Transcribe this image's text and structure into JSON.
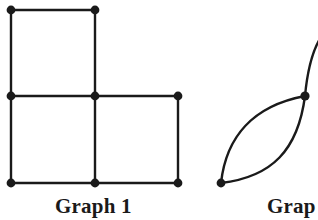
{
  "figure": {
    "width": 318,
    "height": 220,
    "background_color": "#ffffff",
    "stroke_color": "#1a1a1a",
    "vertex_color": "#1a1a1a",
    "stroke_width": 2.4,
    "vertex_radius": 4.2
  },
  "graph1": {
    "caption": "Graph 1",
    "description": "grid graph of three unit squares in an L shape",
    "vertex_count": 7,
    "edge_count": 9,
    "vertices": [
      {
        "id": "v-top-left",
        "x": 11,
        "y": 10
      },
      {
        "id": "v-top-mid",
        "x": 95,
        "y": 10
      },
      {
        "id": "v-mid-left",
        "x": 11,
        "y": 96
      },
      {
        "id": "v-mid-center",
        "x": 95,
        "y": 96
      },
      {
        "id": "v-mid-right",
        "x": 178,
        "y": 96
      },
      {
        "id": "v-bottom-left",
        "x": 11,
        "y": 183
      },
      {
        "id": "v-bottom-mid",
        "x": 95,
        "y": 183
      },
      {
        "id": "v-bottom-right",
        "x": 178,
        "y": 183
      }
    ],
    "edges": [
      {
        "from": "v-top-left",
        "to": "v-top-mid"
      },
      {
        "from": "v-top-left",
        "to": "v-mid-left"
      },
      {
        "from": "v-top-mid",
        "to": "v-mid-center"
      },
      {
        "from": "v-mid-left",
        "to": "v-mid-center"
      },
      {
        "from": "v-mid-center",
        "to": "v-mid-right"
      },
      {
        "from": "v-mid-left",
        "to": "v-bottom-left"
      },
      {
        "from": "v-mid-center",
        "to": "v-bottom-mid"
      },
      {
        "from": "v-mid-right",
        "to": "v-bottom-right"
      },
      {
        "from": "v-bottom-left",
        "to": "v-bottom-mid"
      },
      {
        "from": "v-bottom-mid",
        "to": "v-bottom-right"
      }
    ]
  },
  "graph2": {
    "caption": "Grap",
    "caption_full": "Graph 2",
    "clipped": true,
    "description": "lens shape of two arcs between two vertices, with a further curve through the upper vertex running off the right edge",
    "vertex_count": 2,
    "vertices": [
      {
        "id": "v-lower-left",
        "x": 221,
        "y": 183
      },
      {
        "id": "v-upper-right",
        "x": 305,
        "y": 96
      }
    ],
    "curves": [
      {
        "id": "arc-upper",
        "d": "M 221 183 C 226 138 252 106 305 96"
      },
      {
        "id": "arc-lower",
        "d": "M 221 183 C 270 178 298 148 305 96"
      },
      {
        "id": "curve-through-vertex",
        "d": "M 232 186 C 282 182 300 150 305 96 C 308 66 314 48 320 38"
      }
    ]
  }
}
